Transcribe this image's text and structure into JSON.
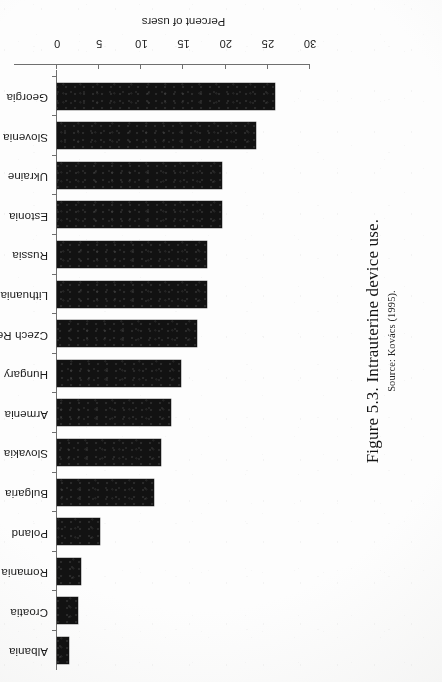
{
  "figure": {
    "caption_title": "Figure 5.3. Intrauterine device use.",
    "caption_source": "Source: Kovács (1995).",
    "rotation_degrees": 180,
    "ink_color": "#121212",
    "axis_color": "#6f6f6f",
    "page_color": "#fdfdfd"
  },
  "chart_data": {
    "type": "bar",
    "orientation": "horizontal",
    "title": "Figure 5.3. Intrauterine device use.",
    "subtitle": "Source: Kovács (1995).",
    "xlabel": "Percent of users",
    "ylabel": "",
    "xlim": [
      0,
      30
    ],
    "xticks": [
      0,
      5,
      10,
      15,
      20,
      25,
      30
    ],
    "xtick_labels": [
      "0",
      "5",
      "10",
      "15",
      "20",
      "25",
      "30"
    ],
    "grid": false,
    "legend": false,
    "categories": [
      "Albania",
      "Croatia",
      "Romania",
      "Poland",
      "Bulgaria",
      "Slovakia",
      "Armenia",
      "Hungary",
      "Czech Republic",
      "Lithuania",
      "Russia",
      "Estonia",
      "Ukraine",
      "Slovenia",
      "Georgia"
    ],
    "values": [
      1.4,
      2.5,
      2.8,
      5.1,
      11.5,
      12.3,
      13.5,
      14.7,
      16.6,
      17.8,
      17.8,
      19.6,
      19.6,
      23.6,
      25.9
    ],
    "units": "percent"
  }
}
